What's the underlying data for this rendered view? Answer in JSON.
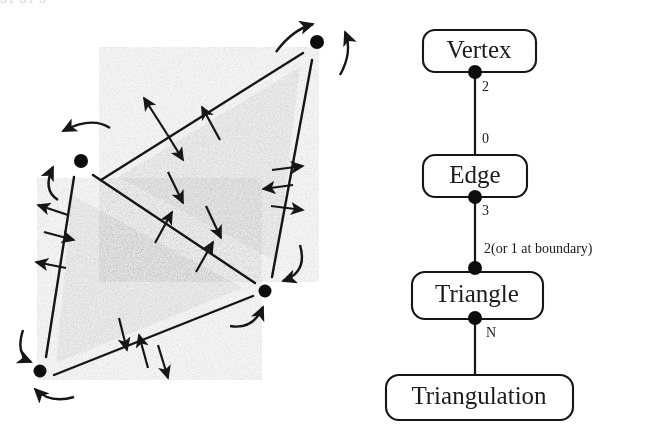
{
  "figure": {
    "title_fragment": "g p g p g",
    "background_color": "#ffffff",
    "ink_color": "#1a1a1a",
    "triangle_fill_color": "#8a8a8a"
  },
  "left_diagram": {
    "name": "triangulation-incidence-diagram",
    "description": "Two shaded triangles sharing an edge, with vertex dots, edge segments, straight incidence arrows and curved vertex arrows",
    "vertices": [
      {
        "id": "v-top",
        "x": 317,
        "y": 42
      },
      {
        "id": "v-left",
        "x": 81,
        "y": 161
      },
      {
        "id": "v-right",
        "x": 265,
        "y": 291
      },
      {
        "id": "v-bottomleft",
        "x": 40,
        "y": 371
      }
    ],
    "edges": [
      {
        "id": "e-top",
        "x1": 101,
        "y1": 180,
        "x2": 303,
        "y2": 53
      },
      {
        "id": "e-right",
        "x1": 312,
        "y1": 60,
        "x2": 272,
        "y2": 277
      },
      {
        "id": "e-diagonal",
        "x1": 93,
        "y1": 175,
        "x2": 255,
        "y2": 283
      },
      {
        "id": "e-left",
        "x1": 74,
        "y1": 177,
        "x2": 46,
        "y2": 357
      },
      {
        "id": "e-bottom",
        "x1": 54,
        "y1": 375,
        "x2": 253,
        "y2": 296
      }
    ],
    "triangles": [
      {
        "id": "t-upper",
        "points": "118,177 300,67 277,262"
      },
      {
        "id": "t-lower",
        "points": "72,195 243,288 56,363"
      }
    ]
  },
  "right_diagram": {
    "name": "entity-hierarchy-diagram",
    "nodes": [
      {
        "id": "vertex",
        "label": "Vertex",
        "x": 423,
        "y": 30,
        "w": 113,
        "h": 42,
        "font_size": 26
      },
      {
        "id": "edge",
        "label": "Edge",
        "x": 423,
        "y": 155,
        "w": 104,
        "h": 42,
        "font_size": 26
      },
      {
        "id": "triangle",
        "label": "Triangle",
        "x": 412,
        "y": 272,
        "w": 131,
        "h": 47,
        "font_size": 26
      },
      {
        "id": "triangulation",
        "label": "Triangulation",
        "x": 386,
        "y": 375,
        "w": 187,
        "h": 45,
        "font_size": 26
      }
    ],
    "connectors": [
      {
        "id": "vertex-edge",
        "x": 475,
        "y1": 72,
        "y2": 155
      },
      {
        "id": "edge-triangle",
        "x": 475,
        "y1": 197,
        "y2": 268
      },
      {
        "id": "triangle-triangulation",
        "x": 475,
        "y1": 318,
        "y2": 375
      }
    ],
    "junction_dots": [
      {
        "id": "dot-vertex-bottom",
        "x": 475,
        "y": 72
      },
      {
        "id": "dot-edge-bottom",
        "x": 475,
        "y": 197
      },
      {
        "id": "dot-triangle-top",
        "x": 475,
        "y": 268
      },
      {
        "id": "dot-triangle-bottom",
        "x": 475,
        "y": 318
      }
    ],
    "multiplicities": [
      {
        "id": "mult-vertex-side",
        "text": "2",
        "x": 482,
        "y": 87,
        "font_size": 15
      },
      {
        "id": "mult-edge-top",
        "text": "0",
        "x": 482,
        "y": 140,
        "font_size": 15
      },
      {
        "id": "mult-edge-bottom",
        "text": "3",
        "x": 482,
        "y": 211,
        "font_size": 15
      },
      {
        "id": "mult-triangle-top",
        "text": "2(or 1 at boundary)",
        "x": 484,
        "y": 250,
        "font_size": 15
      },
      {
        "id": "mult-triangle-bottom",
        "text": "N",
        "x": 485,
        "y": 333,
        "font_size": 15
      }
    ]
  }
}
